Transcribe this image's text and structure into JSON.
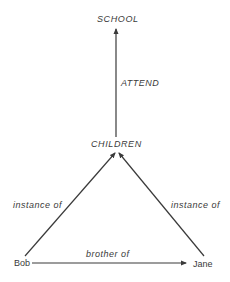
{
  "diagram": {
    "type": "semantic network",
    "nodes": {
      "school": "SCHOOL",
      "children": "CHILDREN",
      "bob": "Bob",
      "jane": "Jane"
    },
    "edges": {
      "attend": "ATTEND",
      "instance_left": "instance of",
      "instance_right": "instance of",
      "brother": "brother of"
    },
    "colors": {
      "line": "#3a3a3a",
      "text": "#3a3a3a",
      "background": "#ffffff"
    }
  }
}
